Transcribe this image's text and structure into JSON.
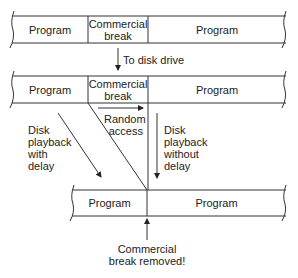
{
  "diagram": {
    "top_tape": {
      "segments": [
        "Program",
        "Commercial break",
        "Program"
      ],
      "seg1": "Program",
      "seg2_line1": "Commercial",
      "seg2_line2": "break",
      "seg3": "Program"
    },
    "to_disk_label": "To disk drive",
    "middle_tape": {
      "segments": [
        "Program",
        "Commercial break",
        "Program"
      ],
      "seg1": "Program",
      "seg2_line1": "Commercial",
      "seg2_line2": "break",
      "seg3": "Program"
    },
    "random_access": {
      "line1": "Random",
      "line2": "access"
    },
    "playback_with_delay": {
      "line1": "Disk",
      "line2": "playback",
      "line3": "with",
      "line4": "delay"
    },
    "playback_without_delay": {
      "line1": "Disk",
      "line2": "playback",
      "line3": "without",
      "line4": "delay"
    },
    "bottom_tape": {
      "segments": [
        "Program",
        "Program"
      ],
      "seg1": "Program",
      "seg2": "Program"
    },
    "removed_label": {
      "line1": "Commercial",
      "line2": "break removed!"
    },
    "colors": {
      "line": "#333333",
      "text": "#222222",
      "background": "#ffffff"
    }
  }
}
